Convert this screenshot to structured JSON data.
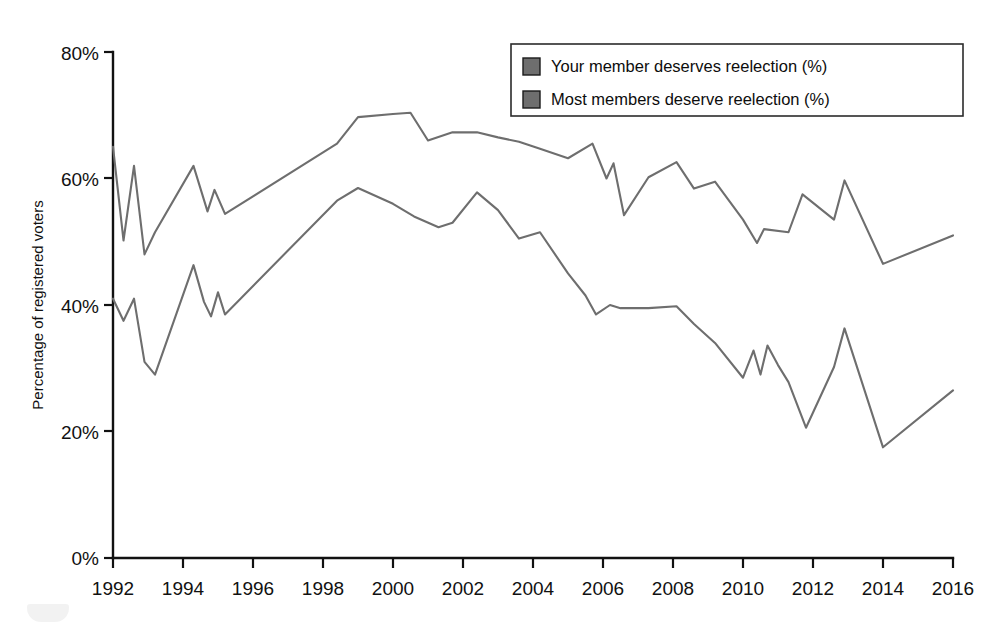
{
  "chart_data": {
    "type": "line",
    "title": "",
    "xlabel": "",
    "ylabel": "Percentage of registered voters",
    "xlim": [
      1992,
      2016
    ],
    "ylim": [
      0,
      80
    ],
    "grid": false,
    "legend_position": "top-right",
    "y_ticks": [
      "0%",
      "20%",
      "40%",
      "60%",
      "80%"
    ],
    "y_tick_values": [
      0,
      20,
      40,
      60,
      80
    ],
    "x_ticks": [
      "1992",
      "1994",
      "1996",
      "1998",
      "2000",
      "2002",
      "2004",
      "2006",
      "2008",
      "2010",
      "2012",
      "2014",
      "2016"
    ],
    "x_tick_values": [
      1992,
      1994,
      1996,
      1998,
      2000,
      2002,
      2004,
      2006,
      2008,
      2010,
      2012,
      2014,
      2016
    ],
    "series": [
      {
        "name": "Your member deserves reelection (%)",
        "color": "#6e6e6e",
        "x": [
          1992.0,
          1992.3,
          1992.6,
          1992.9,
          1993.2,
          1994.3,
          1994.7,
          1994.9,
          1995.2,
          1998.4,
          1999.0,
          2000.0,
          2000.5,
          2001.0,
          2001.7,
          2002.4,
          2003.0,
          2003.6,
          2004.2,
          2005.0,
          2005.7,
          2006.1,
          2006.3,
          2006.6,
          2007.3,
          2008.1,
          2008.6,
          2009.2,
          2010.0,
          2010.4,
          2010.6,
          2011.3,
          2011.7,
          2012.6,
          2012.9,
          2014.0,
          2016.0
        ],
        "y": [
          65.0,
          50.2,
          62.0,
          48.0,
          51.5,
          62.0,
          54.8,
          58.2,
          54.4,
          65.5,
          69.7,
          70.2,
          70.4,
          66.0,
          67.3,
          67.3,
          66.5,
          65.8,
          64.7,
          63.2,
          65.5,
          60.0,
          62.4,
          54.2,
          60.2,
          62.6,
          58.4,
          59.5,
          53.5,
          49.8,
          52.0,
          51.5,
          57.5,
          53.5,
          59.7,
          46.5,
          51.0
        ]
      },
      {
        "name": "Most members deserve reelection (%)",
        "color": "#6e6e6e",
        "x": [
          1992.0,
          1992.3,
          1992.6,
          1992.9,
          1993.2,
          1994.3,
          1994.6,
          1994.8,
          1995.0,
          1995.2,
          1998.4,
          1999.0,
          2000.0,
          2000.6,
          2001.3,
          2001.7,
          2002.4,
          2003.0,
          2003.6,
          2004.2,
          2005.0,
          2005.5,
          2005.8,
          2006.2,
          2006.5,
          2007.3,
          2008.1,
          2008.6,
          2009.2,
          2010.0,
          2010.3,
          2010.5,
          2010.7,
          2011.0,
          2011.3,
          2011.8,
          2012.6,
          2012.9,
          2014.0,
          2016.0
        ],
        "y": [
          41.0,
          37.5,
          41.0,
          31.0,
          29.0,
          46.3,
          40.5,
          38.2,
          42.0,
          38.5,
          56.5,
          58.5,
          56.0,
          54.0,
          52.3,
          53.0,
          57.8,
          55.0,
          50.5,
          51.5,
          45.0,
          41.5,
          38.5,
          40.0,
          39.5,
          39.5,
          39.8,
          37.0,
          34.0,
          28.5,
          32.8,
          29.0,
          33.6,
          30.5,
          27.8,
          20.6,
          30.2,
          36.3,
          17.5,
          26.5
        ]
      }
    ]
  },
  "legend": {
    "entries": [
      {
        "label": "Your member deserves reelection (%)",
        "swatch_color": "#6e6e6e"
      },
      {
        "label": "Most members deserve reelection (%)",
        "swatch_color": "#6e6e6e"
      }
    ]
  },
  "axes": {
    "y_axis_title": "Percentage of registered voters"
  }
}
